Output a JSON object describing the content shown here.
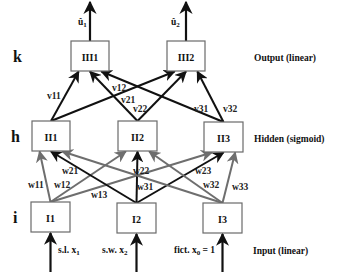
{
  "colors": {
    "black_edge": "#111111",
    "gray_edge": "#6e6e6e",
    "box_stroke": "#6a6a6a"
  },
  "layers": {
    "output": {
      "letter": "k",
      "description": "Output (linear)",
      "y": 56
    },
    "hidden": {
      "letter": "h",
      "description": "Hidden (sigmoid)",
      "y": 136
    },
    "input": {
      "letter": "i",
      "description": "Input (linear)",
      "y": 217
    }
  },
  "nodes": {
    "output": [
      {
        "id": "III1",
        "label": "III1",
        "x": 71,
        "y": 41,
        "w": 38,
        "h": 30
      },
      {
        "id": "III2",
        "label": "III2",
        "x": 167,
        "y": 41,
        "w": 38,
        "h": 30
      }
    ],
    "hidden": [
      {
        "id": "II1",
        "label": "II1",
        "x": 32,
        "y": 121,
        "w": 38,
        "h": 30
      },
      {
        "id": "II2",
        "label": "II2",
        "x": 118,
        "y": 121,
        "w": 39,
        "h": 30
      },
      {
        "id": "II3",
        "label": "II3",
        "x": 204,
        "y": 122,
        "w": 39,
        "h": 30
      }
    ],
    "input": [
      {
        "id": "I1",
        "label": "I1",
        "x": 31,
        "y": 202,
        "w": 39,
        "h": 30
      },
      {
        "id": "I2",
        "label": "I2",
        "x": 117,
        "y": 203,
        "w": 39,
        "h": 30
      },
      {
        "id": "I3",
        "label": "I3",
        "x": 203,
        "y": 203,
        "w": 39,
        "h": 30
      }
    ]
  },
  "outputs": [
    {
      "node": "III1",
      "label": "û",
      "sub": "1",
      "label_x": 78,
      "label_y": 25
    },
    {
      "node": "III2",
      "label": "û",
      "sub": "2",
      "label_x": 171,
      "label_y": 25
    }
  ],
  "inputs": [
    {
      "node": "I1",
      "label": "s.l. x",
      "sub": "1",
      "label_x": 58,
      "label_y": 253
    },
    {
      "node": "I2",
      "label": "s.w. x",
      "sub": "2",
      "label_x": 102,
      "label_y": 253
    },
    {
      "node": "I3",
      "label": "fict. x",
      "sub": "0",
      "suffix": " = 1",
      "label_x": 174,
      "label_y": 253
    }
  ],
  "hidden_to_output_edges": [
    {
      "from": "II1",
      "to": "III1",
      "label": "v11",
      "color": "black",
      "label_x": 47,
      "label_y": 99
    },
    {
      "from": "II1",
      "to": "III2",
      "label": "v12",
      "color": "black",
      "label_x": 112,
      "label_y": 91
    },
    {
      "from": "II2",
      "to": "III1",
      "label": "v21",
      "color": "black",
      "label_x": 121,
      "label_y": 103
    },
    {
      "from": "II2",
      "to": "III2",
      "label": "v22",
      "color": "black",
      "label_x": 133,
      "label_y": 112
    },
    {
      "from": "II3",
      "to": "III1",
      "label": "v31",
      "color": "black",
      "label_x": 194,
      "label_y": 112
    },
    {
      "from": "II3",
      "to": "III2",
      "label": "v32",
      "color": "black",
      "label_x": 223,
      "label_y": 112
    }
  ],
  "input_to_hidden_edges": [
    {
      "from": "I1",
      "to": "II1",
      "label": "w11",
      "color": "gray",
      "label_x": 28,
      "label_y": 188
    },
    {
      "from": "I1",
      "to": "II2",
      "label": "w12",
      "color": "gray",
      "label_x": 54,
      "label_y": 188
    },
    {
      "from": "I1",
      "to": "II3",
      "label": "w13",
      "color": "gray",
      "label_x": 91,
      "label_y": 198
    },
    {
      "from": "I2",
      "to": "II1",
      "label": "w21",
      "color": "black",
      "label_x": 62,
      "label_y": 174
    },
    {
      "from": "I2",
      "to": "II2",
      "label": "w22",
      "color": "black",
      "label_x": 133,
      "label_y": 174
    },
    {
      "from": "I2",
      "to": "II3",
      "label": "w23",
      "color": "black",
      "label_x": 195,
      "label_y": 174
    },
    {
      "from": "I3",
      "to": "II1",
      "label": "w31",
      "color": "gray",
      "label_x": 137,
      "label_y": 190
    },
    {
      "from": "I3",
      "to": "II2",
      "label": "w32",
      "color": "gray",
      "label_x": 203,
      "label_y": 188
    },
    {
      "from": "I3",
      "to": "II3",
      "label": "w33",
      "color": "gray",
      "label_x": 232,
      "label_y": 190
    }
  ]
}
